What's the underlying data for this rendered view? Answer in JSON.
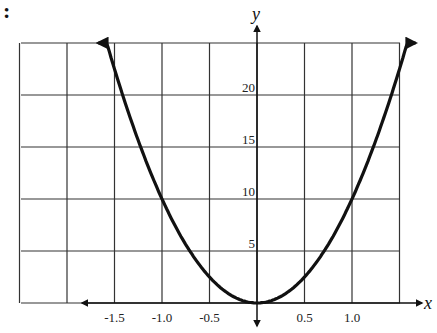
{
  "prefix": ":",
  "chart_data": {
    "type": "line",
    "title": "",
    "xlabel": "x",
    "ylabel": "y",
    "function": "y = 10x^2",
    "xlim": [
      -2.5,
      1.5
    ],
    "ylim": [
      0,
      25
    ],
    "grid": true,
    "x_ticks": [
      -1.5,
      -1.0,
      -0.5,
      0.5,
      1.0
    ],
    "x_tick_labels": [
      "-1.5",
      "-1.0",
      "-0.5",
      "0.5",
      "1.0"
    ],
    "y_ticks": [
      5,
      10,
      15,
      20
    ],
    "y_tick_labels": [
      "5",
      "10",
      "15",
      "20"
    ],
    "series": [
      {
        "name": "parabola",
        "x": [
          -1.6,
          -1.5,
          -1.25,
          -1.0,
          -0.75,
          -0.5,
          -0.25,
          0,
          0.25,
          0.5,
          0.75,
          1.0,
          1.25,
          1.5,
          1.6
        ],
        "values": [
          25.6,
          22.5,
          15.6,
          10,
          5.6,
          2.5,
          0.6,
          0,
          0.6,
          2.5,
          5.6,
          10,
          15.6,
          22.5,
          25.6
        ]
      }
    ],
    "annotations": [
      "arrowheads at both ends of curve",
      "axis arrows"
    ]
  },
  "geometry": {
    "x0": 21,
    "x1": 400,
    "y0": 43,
    "y1": 303,
    "originX": 257,
    "originY": 303,
    "pxPerX": 95,
    "pxPerY": 10.4
  }
}
